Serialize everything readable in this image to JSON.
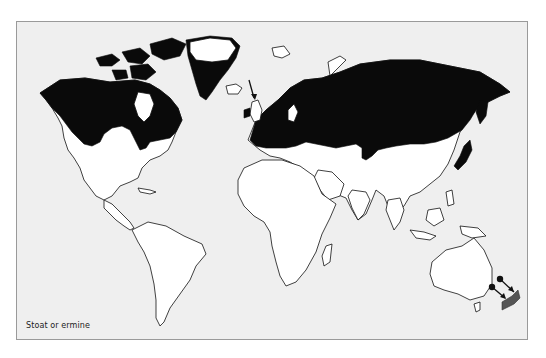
{
  "map": {
    "caption": "Stoat or ermine",
    "legend": {
      "native_range_color": "#0a0a0a",
      "introduced_range_color": "#555555",
      "land_color": "#ffffff",
      "ocean_color": "#efefef"
    },
    "regions": [
      {
        "name": "North America (Canada, Alaska, northern USA)",
        "status": "native-range"
      },
      {
        "name": "Greenland (southern/coastal)",
        "status": "native-range"
      },
      {
        "name": "Europe",
        "status": "native-range"
      },
      {
        "name": "Northern Asia / Siberia",
        "status": "native-range"
      },
      {
        "name": "Japan (northern)",
        "status": "native-range"
      },
      {
        "name": "New Zealand",
        "status": "introduced"
      }
    ],
    "annotations": [
      {
        "type": "arrow",
        "target": "Ireland / Great Britain"
      },
      {
        "type": "arrow",
        "target": "New Zealand",
        "from": "Australia side (introduction)"
      },
      {
        "type": "arrow",
        "target": "New Zealand",
        "from": "Australia side (introduction)"
      }
    ]
  }
}
